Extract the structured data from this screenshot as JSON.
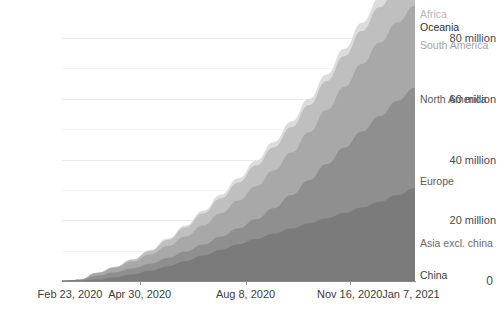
{
  "chart_data": {
    "type": "area",
    "title": "",
    "xlabel": "",
    "ylabel": "",
    "stacked": true,
    "grid": true,
    "legend_position": "right-inline",
    "ylim": [
      0,
      88000000
    ],
    "y_ticks": [
      {
        "value": 0,
        "label": "0"
      },
      {
        "value": 20000000,
        "label": "20 million"
      },
      {
        "value": 40000000,
        "label": "40 million"
      },
      {
        "value": 60000000,
        "label": "60 million"
      },
      {
        "value": 80000000,
        "label": "80 million"
      }
    ],
    "y_minor_ticks": [
      10000000,
      30000000,
      50000000,
      70000000
    ],
    "x_ticks": [
      {
        "position": 0.0,
        "label": "Feb 23, 2020"
      },
      {
        "position": 0.22,
        "label": "Apr 30, 2020"
      },
      {
        "position": 0.52,
        "label": "Aug 8, 2020"
      },
      {
        "position": 0.815,
        "label": "Nov 16, 2020"
      },
      {
        "position": 1.0,
        "label": "Jan 7, 2021"
      }
    ],
    "x_start": "Feb 23, 2020",
    "x_end": "Jan 7, 2021",
    "x": [
      0,
      0.05,
      0.1,
      0.15,
      0.2,
      0.25,
      0.3,
      0.35,
      0.4,
      0.45,
      0.5,
      0.55,
      0.6,
      0.65,
      0.7,
      0.75,
      0.8,
      0.85,
      0.9,
      0.95,
      1.0
    ],
    "series": [
      {
        "name": "China",
        "color": "#6e6e6e",
        "label_color": "#3d3d3d",
        "values": [
          80000,
          82000,
          84000,
          84500,
          85000,
          85300,
          85500,
          85600,
          85700,
          85800,
          86000,
          86200,
          86400,
          86600,
          86800,
          87000,
          87200,
          87400,
          90000,
          93000,
          96000
        ]
      },
      {
        "name": "Asia excl. china",
        "color": "#7b7b7b",
        "label_color": "#6a6a6a",
        "values": [
          20000,
          120000,
          450000,
          1100000,
          2100000,
          3300000,
          4800000,
          6500000,
          8300000,
          10200000,
          12000000,
          13800000,
          15500000,
          17200000,
          18900000,
          20600000,
          22300000,
          24100000,
          26000000,
          28200000,
          30500000
        ]
      },
      {
        "name": "Europe",
        "color": "#8f8f8f",
        "label_color": "#5a5a5a",
        "values": [
          5000,
          180000,
          1200000,
          1700000,
          2000000,
          2300000,
          2700000,
          3100000,
          3600000,
          4300000,
          5200000,
          6500000,
          8400000,
          11000000,
          14200000,
          17800000,
          21500000,
          25000000,
          28200000,
          31000000,
          33000000
        ]
      },
      {
        "name": "North America",
        "color": "#a8a8a8",
        "label_color": "#5a5a5a",
        "values": [
          1000,
          60000,
          900000,
          1500000,
          2200000,
          3000000,
          3900000,
          5000000,
          6300000,
          7700000,
          9200000,
          10800000,
          12400000,
          14000000,
          15800000,
          17800000,
          20000000,
          22300000,
          24200000,
          25800000,
          27000000
        ]
      },
      {
        "name": "South America",
        "color": "#bfbfbf",
        "label_color": "#a2a2a2",
        "values": [
          0,
          3000,
          60000,
          220000,
          600000,
          1200000,
          2000000,
          2900000,
          3900000,
          4900000,
          5900000,
          6800000,
          7600000,
          8300000,
          8900000,
          9500000,
          10100000,
          10800000,
          11600000,
          12400000,
          13200000
        ]
      },
      {
        "name": "Oceania",
        "color": "#d0d0d0",
        "label_color": "#2e2e2e",
        "values": [
          0,
          2000,
          8000,
          9000,
          10000,
          11000,
          12000,
          13000,
          14000,
          16000,
          18000,
          22000,
          26000,
          28000,
          30000,
          32000,
          34000,
          37000,
          42000,
          48000,
          55000
        ]
      },
      {
        "name": "Africa",
        "color": "#dcdcdc",
        "label_color": "#b5b5b5",
        "values": [
          0,
          1000,
          20000,
          70000,
          160000,
          300000,
          480000,
          700000,
          950000,
          1200000,
          1400000,
          1600000,
          1750000,
          1900000,
          2050000,
          2200000,
          2400000,
          2700000,
          3000000,
          3300000,
          3600000
        ]
      }
    ],
    "series_label_positions": [
      {
        "name": "Africa",
        "y": 14
      },
      {
        "name": "Oceania",
        "y": 27
      },
      {
        "name": "South America",
        "y": 45
      },
      {
        "name": "North America",
        "y": 99
      },
      {
        "name": "Europe",
        "y": 181
      },
      {
        "name": "Asia excl. china",
        "y": 243
      },
      {
        "name": "China",
        "y": 275
      }
    ]
  },
  "axis": {
    "y_tick_labels": [
      "0",
      "20 million",
      "40 million",
      "60 million",
      "80 million"
    ],
    "x_tick_labels": [
      "Feb 23, 2020",
      "Apr 30, 2020",
      "Aug 8, 2020",
      "Nov 16, 2020",
      "Jan 7, 2021"
    ]
  }
}
